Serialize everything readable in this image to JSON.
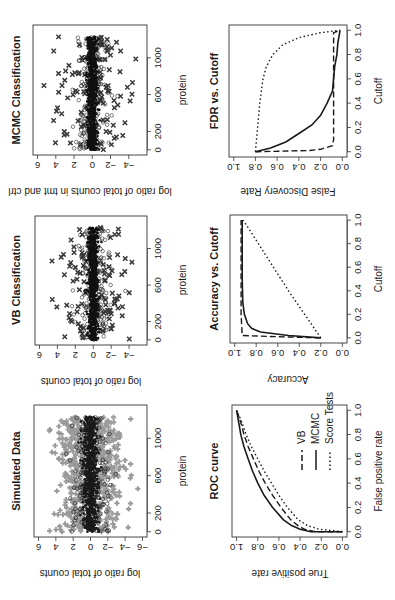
{
  "figure": {
    "orientation": "rotated 90 degrees counterclockwise",
    "colors": {
      "ink": "#1a1a1a",
      "gray_points": "#9a9a9a",
      "background": "#ffffff"
    }
  },
  "chart_data": [
    {
      "id": "simulated",
      "type": "scatter",
      "title": "Simulated Data",
      "xlabel": "protein",
      "ylabel": "log ratio of total counts",
      "xticks": [
        0,
        200,
        600,
        1000
      ],
      "yticks": [
        -6,
        -4,
        -2,
        0,
        2,
        4,
        6
      ],
      "xlim": [
        0,
        1300
      ],
      "ylim": [
        -6,
        6
      ],
      "series": [
        {
          "name": "non-differential",
          "marker": "plus",
          "color": "#9a9a9a",
          "spread": 3.2
        },
        {
          "name": "core",
          "marker": "dot",
          "color": "#1a1a1a",
          "spread": 0.9
        },
        {
          "name": "open",
          "marker": "circle",
          "color": "#1a1a1a",
          "spread": 2.2
        }
      ]
    },
    {
      "id": "vb",
      "type": "scatter",
      "title": "VB Classification",
      "xlabel": "protein",
      "ylabel": "log ratio of total counts",
      "xticks": [
        0,
        200,
        600,
        1000
      ],
      "yticks": [
        -4,
        -2,
        0,
        2,
        4,
        6
      ],
      "xlim": [
        0,
        1300
      ],
      "ylim": [
        -5.5,
        6
      ],
      "series": [
        {
          "name": "differential",
          "marker": "x",
          "color": "#3a3a3a",
          "spread": 3.5
        },
        {
          "name": "non-differential",
          "marker": "circle",
          "color": "#2a2a2a",
          "spread": 1.8
        },
        {
          "name": "core",
          "marker": "dot",
          "color": "#111111",
          "spread": 0.6
        }
      ]
    },
    {
      "id": "mcmc",
      "type": "scatter",
      "title": "MCMC Classification",
      "xlabel": "protein",
      "ylabel": "log ratio of total counts in tmt and ctrl",
      "xticks": [
        0,
        200,
        600,
        1000
      ],
      "yticks": [
        -4,
        -2,
        0,
        2,
        4,
        6
      ],
      "xlim": [
        0,
        1300
      ],
      "ylim": [
        -5.5,
        6
      ],
      "series": [
        {
          "name": "differential",
          "marker": "x",
          "color": "#3a3a3a",
          "spread": 3.5
        },
        {
          "name": "non-differential",
          "marker": "circle",
          "color": "#2a2a2a",
          "spread": 1.8
        },
        {
          "name": "core",
          "marker": "dot",
          "color": "#111111",
          "spread": 0.6
        }
      ]
    },
    {
      "id": "roc",
      "type": "line",
      "title": "ROC curve",
      "xlabel": "False positive rate",
      "ylabel": "True positive rate",
      "xticks": [
        0.0,
        0.2,
        0.4,
        0.6,
        0.8,
        1.0
      ],
      "yticks": [
        0.0,
        0.2,
        0.4,
        0.6,
        0.8,
        1.0
      ],
      "xlim": [
        0,
        1
      ],
      "ylim": [
        0,
        1
      ],
      "legend": [
        "VB",
        "MCMC",
        "Score Tests"
      ],
      "series": [
        {
          "name": "VB",
          "dash": "6,3",
          "x": [
            0,
            0.0,
            0.02,
            0.05,
            0.1,
            0.2,
            0.3,
            0.4,
            0.5,
            0.6,
            0.7,
            0.8,
            0.9,
            1.0
          ],
          "y": [
            0,
            0.25,
            0.36,
            0.42,
            0.49,
            0.58,
            0.66,
            0.73,
            0.79,
            0.84,
            0.89,
            0.93,
            0.96,
            1.0
          ]
        },
        {
          "name": "MCMC",
          "dash": "",
          "x": [
            0,
            0.0,
            0.02,
            0.05,
            0.1,
            0.2,
            0.3,
            0.4,
            0.5,
            0.6,
            0.7,
            0.8,
            0.9,
            1.0
          ],
          "y": [
            0,
            0.3,
            0.4,
            0.48,
            0.56,
            0.66,
            0.74,
            0.8,
            0.85,
            0.89,
            0.93,
            0.96,
            0.98,
            1.0
          ]
        },
        {
          "name": "Score Tests",
          "dash": "1.5,2.5",
          "x": [
            0,
            0.02,
            0.05,
            0.1,
            0.2,
            0.3,
            0.4,
            0.5,
            0.6,
            0.7,
            0.8,
            0.9,
            1.0
          ],
          "y": [
            0,
            0.22,
            0.33,
            0.42,
            0.52,
            0.6,
            0.67,
            0.74,
            0.8,
            0.86,
            0.91,
            0.95,
            1.0
          ]
        }
      ]
    },
    {
      "id": "accuracy",
      "type": "line",
      "title": "Accuracy vs. Cutoff",
      "xlabel": "Cutoff",
      "ylabel": "Accuracy",
      "xticks": [
        0.0,
        0.2,
        0.4,
        0.6,
        0.8,
        1.0
      ],
      "yticks": [
        0.0,
        0.2,
        0.4,
        0.6,
        0.8,
        1.0
      ],
      "xlim": [
        0,
        1
      ],
      "ylim": [
        0,
        1
      ],
      "series": [
        {
          "name": "VB",
          "dash": "6,3",
          "x": [
            0.0,
            0.0,
            0.01,
            0.02,
            0.2,
            0.5,
            1.0
          ],
          "y": [
            0.2,
            0.21,
            0.6,
            0.93,
            0.94,
            0.94,
            0.94
          ]
        },
        {
          "name": "MCMC",
          "dash": "",
          "x": [
            0.0,
            0.02,
            0.05,
            0.08,
            0.12,
            0.2,
            0.3,
            0.5,
            1.0
          ],
          "y": [
            0.2,
            0.5,
            0.76,
            0.84,
            0.88,
            0.91,
            0.925,
            0.93,
            0.93
          ]
        },
        {
          "name": "Score Tests",
          "dash": "1.5,2.5",
          "x": [
            0.0,
            0.2,
            0.4,
            0.6,
            0.8,
            1.0
          ],
          "y": [
            0.2,
            0.35,
            0.5,
            0.64,
            0.78,
            0.92
          ]
        }
      ]
    },
    {
      "id": "fdr",
      "type": "line",
      "title": "FDR vs. Cutoff",
      "xlabel": "Cutoff",
      "ylabel": "False Discovery Rate",
      "xticks": [
        0.0,
        0.2,
        0.4,
        0.6,
        0.8,
        1.0
      ],
      "yticks": [
        0.0,
        0.2,
        0.4,
        0.6,
        0.8,
        1.0
      ],
      "xlim": [
        0,
        1
      ],
      "ylim": [
        0,
        1
      ],
      "series": [
        {
          "name": "VB",
          "dash": "6,3",
          "x": [
            0.0,
            0.0,
            0.01,
            0.02,
            0.05,
            0.1,
            0.3,
            0.6,
            0.9,
            0.98,
            1.0
          ],
          "y": [
            0.8,
            0.78,
            0.3,
            0.2,
            0.09,
            0.08,
            0.08,
            0.08,
            0.08,
            0.08,
            0.02
          ]
        },
        {
          "name": "MCMC",
          "dash": "",
          "x": [
            0.0,
            0.03,
            0.08,
            0.15,
            0.22,
            0.3,
            0.4,
            0.5,
            0.6,
            0.7,
            0.8,
            0.9,
            1.0
          ],
          "y": [
            0.8,
            0.66,
            0.52,
            0.4,
            0.28,
            0.2,
            0.14,
            0.09,
            0.08,
            0.07,
            0.05,
            0.04,
            0.02
          ]
        },
        {
          "name": "Score Tests",
          "dash": "1.5,2.5",
          "x": [
            0.0,
            0.2,
            0.4,
            0.6,
            0.7,
            0.8,
            0.88,
            0.94,
            0.98,
            1.0
          ],
          "y": [
            0.8,
            0.78,
            0.76,
            0.73,
            0.7,
            0.64,
            0.55,
            0.4,
            0.2,
            0.02
          ]
        }
      ]
    }
  ]
}
